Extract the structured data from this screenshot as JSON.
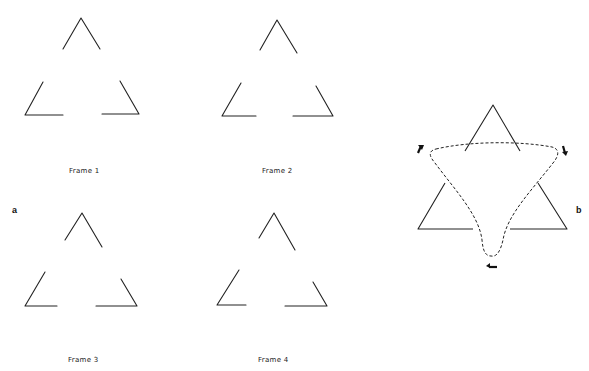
{
  "panels": {
    "a": {
      "letter": "a",
      "frames": [
        {
          "label": "Frame 1",
          "top": [
            [
              63,
              49
            ],
            [
              81,
              18
            ],
            [
              100,
              49
            ]
          ],
          "left": [
            [
              43,
              82
            ],
            [
              25,
              115
            ],
            [
              63,
              115
            ]
          ],
          "right": [
            [
              120,
              81
            ],
            [
              139,
              114
            ],
            [
              102,
              114
            ]
          ]
        },
        {
          "label": "Frame 2",
          "top": [
            [
              260,
              50
            ],
            [
              277,
              20
            ],
            [
              297,
              53
            ]
          ],
          "left": [
            [
              241,
              83
            ],
            [
              222,
              116
            ],
            [
              256,
              116
            ]
          ],
          "right": [
            [
              316,
              86
            ],
            [
              333,
              116
            ],
            [
              293,
              116
            ]
          ]
        },
        {
          "label": "Frame 3",
          "top": [
            [
              65,
              240
            ],
            [
              82,
              213
            ],
            [
              102,
              247
            ]
          ],
          "left": [
            [
              45,
              272
            ],
            [
              25,
              306
            ],
            [
              57,
              306
            ]
          ],
          "right": [
            [
              121,
              279
            ],
            [
              137,
              306
            ],
            [
              96,
              306
            ]
          ]
        },
        {
          "label": "Frame 4",
          "top": [
            [
              259,
              238
            ],
            [
              274,
              213
            ],
            [
              295,
              250
            ]
          ],
          "left": [
            [
              239,
              270
            ],
            [
              217,
              305
            ],
            [
              246,
              305
            ]
          ],
          "right": [
            [
              313,
              282
            ],
            [
              327,
              306
            ],
            [
              285,
              306
            ]
          ]
        }
      ]
    },
    "b": {
      "letter": "b",
      "triangles": {
        "top": [
          [
            465,
            151
          ],
          [
            493,
            105
          ],
          [
            520,
            151
          ]
        ],
        "left": [
          [
            445,
            183
          ],
          [
            418,
            229
          ],
          [
            473,
            229
          ]
        ],
        "right": [
          [
            538,
            183
          ],
          [
            567,
            229
          ],
          [
            510,
            229
          ]
        ]
      },
      "arrows": [
        "rotation-arrow-top-left",
        "rotation-arrow-top-right",
        "rotation-arrow-bottom"
      ]
    }
  }
}
